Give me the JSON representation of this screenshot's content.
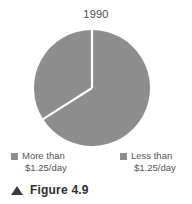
{
  "chart_data": {
    "type": "pie",
    "title": "1990",
    "xlabel": "",
    "ylabel": "",
    "legend_position": "bottom",
    "categories": [
      "More than $1.25/day",
      "Less than $1.25/day"
    ],
    "values": [
      34,
      66
    ],
    "slices": [
      {
        "label": "More than $1.25/day",
        "label_line1": "More than",
        "label_line2": "$1.25/day",
        "value": 34,
        "start_angle_deg": 237,
        "end_angle_deg": 360,
        "color": "#8d8d8d"
      },
      {
        "label": "Less than $1.25/day",
        "label_line1": "Less than",
        "label_line2": "$1.25/day",
        "value": 66,
        "start_angle_deg": 0,
        "end_angle_deg": 237,
        "color": "#8d8d8d"
      }
    ]
  },
  "figure": {
    "marker": "triangle-up",
    "caption": "Figure 4.9"
  },
  "colors": {
    "slice_fill": "#8d8d8d",
    "divider": "#ffffff",
    "title_text": "#4a4a4a",
    "legend_text": "#555555",
    "caption_text": "#2e2e2e",
    "background": "#ffffff"
  }
}
